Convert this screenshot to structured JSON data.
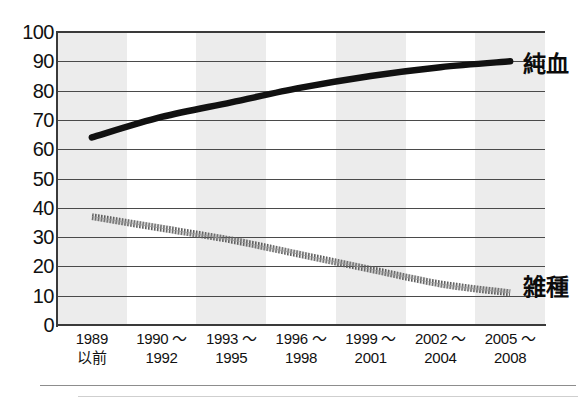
{
  "chart_data": {
    "type": "line",
    "title": "",
    "xlabel": "",
    "ylabel": "",
    "ylim": [
      0,
      100
    ],
    "ytick_step": 10,
    "grid": true,
    "legend": "inline-right",
    "categories": [
      {
        "line1": "1989",
        "line2": "以前"
      },
      {
        "line1": "1990 〜",
        "line2": "1992"
      },
      {
        "line1": "1993 〜",
        "line2": "1995"
      },
      {
        "line1": "1996 〜",
        "line2": "1998"
      },
      {
        "line1": "1999 〜",
        "line2": "2001"
      },
      {
        "line1": "2002 〜",
        "line2": "2004"
      },
      {
        "line1": "2005 〜",
        "line2": "2008"
      }
    ],
    "ytick_labels": [
      "100",
      "90",
      "80",
      "70",
      "60",
      "50",
      "40",
      "30",
      "20",
      "10",
      "0"
    ],
    "ytick_values": [
      100,
      90,
      80,
      70,
      60,
      50,
      40,
      30,
      20,
      10,
      0
    ],
    "series": [
      {
        "name": "純血",
        "style": "solid-thick",
        "color": "#111111",
        "values": [
          64,
          71,
          76,
          81,
          85,
          88,
          90
        ]
      },
      {
        "name": "雑種",
        "style": "dotted-hatched",
        "color": "#555555",
        "values": [
          37,
          33,
          29,
          24,
          19,
          14,
          11
        ]
      }
    ],
    "bands": {
      "color": "#ececec",
      "shaded_indices": [
        0,
        2,
        4,
        6
      ]
    }
  }
}
